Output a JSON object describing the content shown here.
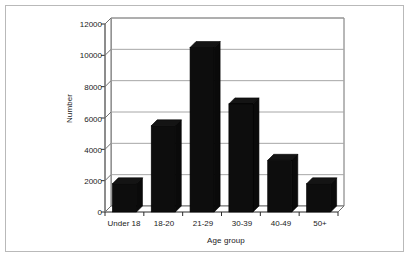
{
  "chart_data": {
    "type": "bar",
    "title": "",
    "subtitle": "",
    "xlabel": "Age group",
    "ylabel": "Number",
    "categories": [
      "Under 18",
      "18-20",
      "21-29",
      "30-39",
      "40-49",
      "50+"
    ],
    "values": [
      1800,
      5500,
      10500,
      6900,
      3300,
      1800
    ],
    "series": [
      {
        "name": "Number",
        "values": [
          1800,
          5500,
          10500,
          6900,
          3300,
          1800
        ]
      }
    ],
    "yticks": [
      0,
      2000,
      4000,
      6000,
      8000,
      10000,
      12000
    ],
    "ytick_labels": [
      "0",
      "2000",
      "4000",
      "6000",
      "8000",
      "10000",
      "12000"
    ],
    "ylim": [
      0,
      12000
    ],
    "grid": "horizontal",
    "legend": "none",
    "style": "3d-column",
    "bar_color": "#0d0d0d",
    "grid_color": "#a6a6a6",
    "axis_color": "#707070",
    "background": "#ffffff",
    "annotations": []
  }
}
